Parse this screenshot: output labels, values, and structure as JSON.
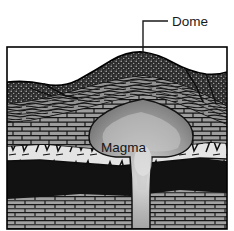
{
  "figure": {
    "background_color": "#ffffff",
    "frame": {
      "x": 7,
      "y": 47,
      "width": 220,
      "height": 182,
      "stroke_color": "#000000"
    }
  },
  "annotations": [
    {
      "id": "dome",
      "label": "Dome",
      "text_x": 172,
      "text_y": 26,
      "leader": {
        "points": "143,54 143,21 168,21",
        "color": "#1a1a1a",
        "width": 1.4
      }
    },
    {
      "id": "magma",
      "label": "Magma",
      "text_x": 101,
      "text_y": 152
    }
  ],
  "colors": {
    "stipple_dark": "#2b2b2b",
    "stipple_dot": "#b9b9b9",
    "shale_gray": "#8f8f8f",
    "shale_line": "#1c1c1c",
    "limestone_gray": "#9a9a9a",
    "limestone_line": "#171717",
    "breccia_light": "#e2e2e2",
    "breccia_line": "#101010",
    "black_bed": "#121212",
    "magma_light": "#d8d8d8",
    "magma_mid": "#a5a5a5",
    "magma_dark": "#7e7e7e",
    "outline": "#000000",
    "white": "#ffffff"
  },
  "strata": [
    {
      "id": "top-stipple",
      "name": "dark stippled surface unit",
      "pattern": "stipple",
      "fill": "#2b2b2b",
      "description": "Arched dark speckled uppermost unit forming the dome surface, broken by normal faults on both flanks"
    },
    {
      "id": "shale-band",
      "name": "wavy laminated shale band",
      "pattern": "wavy-lines",
      "fill": "#8f8f8f",
      "description": "Thin wavy laminated beds arching over the intrusion"
    },
    {
      "id": "limestone-upper",
      "name": "upper brick limestone bed",
      "pattern": "brick",
      "fill": "#9a9a9a",
      "description": "Brick-patterned bed domed upward directly above the magma body"
    },
    {
      "id": "breccia-bed",
      "name": "angular breccia / conglomerate bed",
      "pattern": "breccia",
      "fill": "#e2e2e2",
      "description": "Light bed with angular clast outlines, truncated by the magma conduit"
    },
    {
      "id": "black-bed",
      "name": "black bed",
      "pattern": "solid",
      "fill": "#121212",
      "description": "Solid dark bed beneath the breccia, cut by the feeder conduit"
    },
    {
      "id": "limestone-basal",
      "name": "basal brick limestone bed",
      "pattern": "brick",
      "fill": "#9a9a9a",
      "description": "Flat-lying brick-patterned bed at the base of the section"
    },
    {
      "id": "magma-body",
      "name": "magma intrusion",
      "pattern": "gradient",
      "fill": "#a5a5a5",
      "description": "Mushroom-shaped laccolith with narrow feeder conduit rising from below"
    }
  ]
}
